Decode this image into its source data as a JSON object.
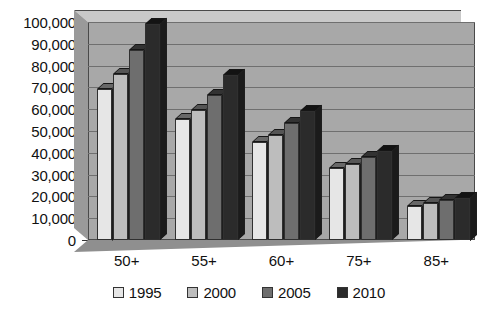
{
  "chart_data": {
    "type": "bar",
    "title": "",
    "xlabel": "",
    "ylabel": "",
    "ylim": [
      0,
      100000
    ],
    "ytick_step": 10000,
    "grid": true,
    "legend_position": "bottom",
    "style": "3d-clustered-column-grayscale",
    "categories": [
      "50+",
      "55+",
      "60+",
      "75+",
      "85+"
    ],
    "ytick_labels": [
      "0",
      "10,000",
      "20,000",
      "30,000",
      "40,000",
      "50,000",
      "60,000",
      "70,000",
      "80,000",
      "90,000",
      "100,000"
    ],
    "series": [
      {
        "name": "1995",
        "color": "#e6e6e6",
        "values": [
          69500,
          55500,
          45000,
          33000,
          15500
        ]
      },
      {
        "name": "2000",
        "color": "#bdbdbd",
        "values": [
          76000,
          59500,
          48000,
          35000,
          17000
        ]
      },
      {
        "name": "2005",
        "color": "#6e6e6e",
        "values": [
          87000,
          66500,
          53500,
          38000,
          18500
        ]
      },
      {
        "name": "2010",
        "color": "#2b2b2b",
        "values": [
          99000,
          75500,
          59000,
          41000,
          19500
        ]
      }
    ]
  },
  "legend": {
    "items": [
      {
        "label": "1995"
      },
      {
        "label": "2000"
      },
      {
        "label": "2005"
      },
      {
        "label": "2010"
      }
    ]
  }
}
